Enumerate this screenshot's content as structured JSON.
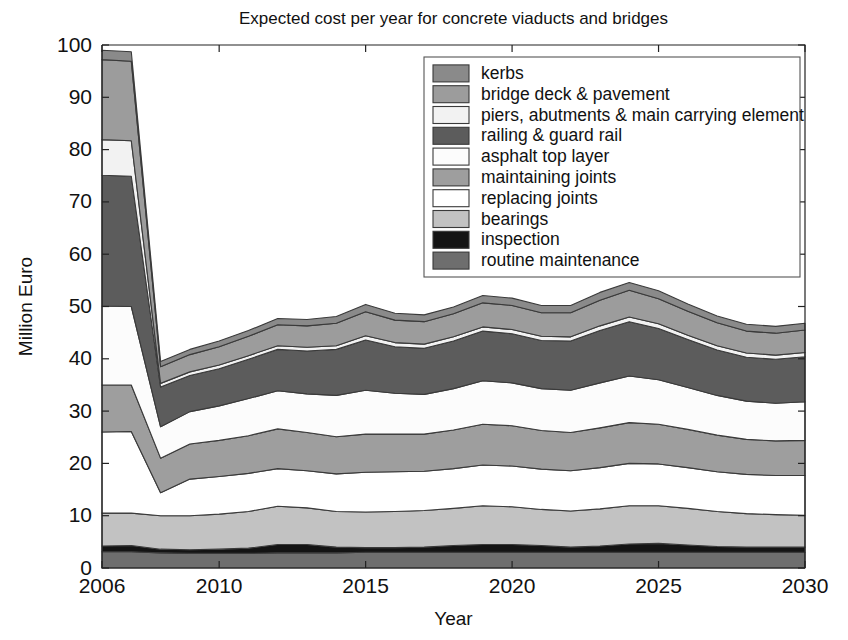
{
  "chart_data": {
    "type": "area",
    "stacked": true,
    "title": "Expected cost per year for concrete viaducts and bridges",
    "xlabel": "Year",
    "ylabel": "Million Euro",
    "xlim": [
      2006,
      2030
    ],
    "ylim": [
      0,
      100
    ],
    "ytick_step": 10,
    "yticks": [
      0,
      10,
      20,
      30,
      40,
      50,
      60,
      70,
      80,
      90,
      100
    ],
    "xticks": [
      2006,
      2010,
      2015,
      2020,
      2025,
      2030
    ],
    "grid": false,
    "legend_position": "upper-right",
    "x": [
      2006,
      2007,
      2008,
      2009,
      2010,
      2011,
      2012,
      2013,
      2014,
      2015,
      2016,
      2017,
      2018,
      2019,
      2020,
      2021,
      2022,
      2023,
      2024,
      2025,
      2026,
      2027,
      2028,
      2029,
      2030
    ],
    "series": [
      {
        "name": "routine maintenance",
        "color": "#6e6e6e",
        "values": [
          3.1,
          3.1,
          2.9,
          2.8,
          2.8,
          2.8,
          2.9,
          2.9,
          2.9,
          3.0,
          3.0,
          3.0,
          3.0,
          3.0,
          3.0,
          3.0,
          3.0,
          3.0,
          3.0,
          3.0,
          3.0,
          3.0,
          3.0,
          3.0,
          3.0
        ]
      },
      {
        "name": "inspection",
        "color": "#141414",
        "values": [
          1.1,
          1.2,
          0.7,
          0.7,
          0.8,
          1.0,
          1.6,
          1.6,
          1.1,
          0.9,
          0.9,
          1.0,
          1.3,
          1.5,
          1.5,
          1.3,
          1.0,
          1.2,
          1.6,
          1.7,
          1.4,
          1.1,
          1.0,
          1.0,
          1.0
        ]
      },
      {
        "name": "bearings",
        "color": "#c2c2c2",
        "values": [
          6.3,
          6.2,
          6.4,
          6.5,
          6.7,
          7.0,
          7.3,
          7.0,
          6.8,
          6.8,
          6.9,
          7.0,
          7.1,
          7.4,
          7.2,
          6.9,
          6.9,
          7.1,
          7.3,
          7.2,
          7.0,
          6.7,
          6.4,
          6.2,
          6.1
        ]
      },
      {
        "name": "replacing joints",
        "color": "#ffffff",
        "values": [
          15.5,
          15.6,
          4.4,
          7.0,
          7.2,
          7.3,
          7.2,
          7.1,
          7.2,
          7.6,
          7.6,
          7.5,
          7.6,
          7.8,
          7.8,
          7.7,
          7.7,
          7.9,
          8.1,
          8.0,
          7.8,
          7.6,
          7.5,
          7.5,
          7.6
        ]
      },
      {
        "name": "maintaining joints",
        "color": "#9e9e9e",
        "values": [
          9.0,
          8.9,
          6.6,
          6.7,
          6.9,
          7.2,
          7.6,
          7.3,
          7.1,
          7.3,
          7.2,
          7.1,
          7.4,
          7.8,
          7.7,
          7.4,
          7.3,
          7.6,
          7.8,
          7.6,
          7.3,
          7.0,
          6.7,
          6.6,
          6.7
        ]
      },
      {
        "name": "asphalt top layer",
        "color": "#fcfcfc",
        "values": [
          15.1,
          15.0,
          6.0,
          6.2,
          6.6,
          7.1,
          7.3,
          7.4,
          7.9,
          8.4,
          7.8,
          7.6,
          7.9,
          8.3,
          8.2,
          8.0,
          8.1,
          8.6,
          8.9,
          8.5,
          8.0,
          7.6,
          7.3,
          7.2,
          7.4
        ]
      },
      {
        "name": "railing & guard rail",
        "color": "#5c5c5c",
        "values": [
          25.0,
          24.9,
          7.6,
          6.9,
          7.1,
          7.5,
          7.9,
          8.2,
          8.8,
          9.6,
          8.9,
          8.8,
          9.1,
          9.5,
          9.4,
          9.2,
          9.4,
          10.0,
          10.4,
          9.8,
          9.2,
          8.7,
          8.4,
          8.4,
          8.6
        ]
      },
      {
        "name": "piers, abutments & main carrying element",
        "color": "#f2f2f2",
        "values": [
          6.8,
          6.8,
          0.7,
          0.7,
          0.7,
          0.7,
          0.7,
          0.7,
          0.7,
          0.8,
          0.8,
          0.8,
          0.8,
          0.8,
          0.8,
          0.8,
          0.8,
          0.9,
          0.9,
          0.9,
          0.8,
          0.8,
          0.8,
          0.8,
          0.8
        ]
      },
      {
        "name": "bridge deck & pavement",
        "color": "#9c9c9c",
        "values": [
          15.3,
          15.2,
          3.2,
          3.3,
          3.5,
          3.7,
          4.0,
          4.1,
          4.3,
          4.6,
          4.3,
          4.3,
          4.4,
          4.6,
          4.6,
          4.5,
          4.6,
          4.9,
          5.1,
          4.8,
          4.6,
          4.4,
          4.2,
          4.2,
          4.3
        ]
      },
      {
        "name": "kerbs",
        "color": "#8a8a8a",
        "values": [
          1.8,
          1.8,
          1.0,
          1.0,
          1.1,
          1.1,
          1.2,
          1.2,
          1.3,
          1.4,
          1.3,
          1.3,
          1.3,
          1.4,
          1.4,
          1.4,
          1.4,
          1.5,
          1.5,
          1.5,
          1.4,
          1.3,
          1.3,
          1.3,
          1.3
        ]
      }
    ],
    "legend_order": [
      "kerbs",
      "bridge deck & pavement",
      "piers, abutments & main carrying element",
      "railing & guard rail",
      "asphalt top layer",
      "maintaining joints",
      "replacing joints",
      "bearings",
      "inspection",
      "routine maintenance"
    ]
  }
}
